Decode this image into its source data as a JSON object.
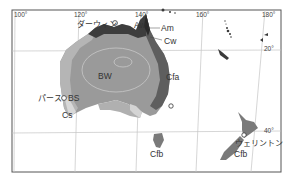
{
  "map": {
    "title": "",
    "colors": {
      "BW": "#9a9a9a",
      "BS": "#bdbdbd",
      "Aw": "#3d3d3d",
      "Am": "#2a2a2a",
      "Cw": "#555555",
      "Cfa": "#5e5e5e",
      "Cs": "#d8d8d8",
      "Cfb": "#7a7a7a",
      "frame": "#555555",
      "grid": "#bcbcbc"
    },
    "longitude_ticks": [
      "100°",
      "120°",
      "140°",
      "160°",
      "180°"
    ],
    "latitude_ticks": [
      "20°",
      "40°"
    ],
    "climate_labels": {
      "aw": "Aw",
      "am": "Am",
      "cw": "Cw",
      "bw": "BW",
      "cfa": "Cfa",
      "bs": "BS",
      "cs": "Cs",
      "cfb_tasmania": "Cfb",
      "cfb_nz": "Cfb"
    },
    "cities": {
      "darwin": "ダーウィン",
      "perth": "パース",
      "wellington": "ウェリントン"
    }
  }
}
